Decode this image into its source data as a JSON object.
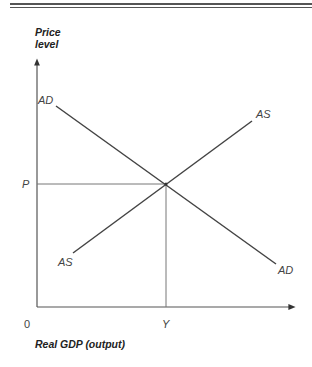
{
  "diagram": {
    "y_axis_label_line1": "Price",
    "y_axis_label_line2": "level",
    "x_axis_label": "Real GDP (output)",
    "origin_label": "0",
    "price_label": "P",
    "output_label": "Y",
    "curves": {
      "ad_upper_label": "AD",
      "ad_lower_label": "AD",
      "as_upper_label": "AS",
      "as_lower_label": "AS"
    },
    "colors": {
      "line": "#444444",
      "guide": "#666666",
      "rule": "#555555"
    }
  }
}
